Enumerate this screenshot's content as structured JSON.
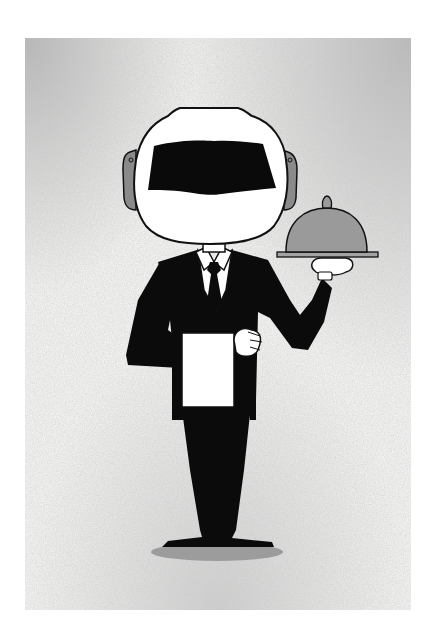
{
  "image": {
    "subject": "robot-helmeted waiter in black suit holding a silver cloche tray",
    "alt": "Illustration of a waiter with a white robot helmet and black visor, wearing a black suit and tie, a white towel over his arm, holding a domed serving cloche on a tray",
    "colors": {
      "background_page": "#ffffff",
      "grunge_panel": "#f1f1f0",
      "grunge_stain": "#bdbdbd",
      "helmet": "#ffffff",
      "visor": "#0a0a0a",
      "earpiece": "#8a8a8a",
      "suit": "#0b0b0b",
      "shirt": "#ffffff",
      "cloche": "#9a9a9a",
      "tray": "#a3a3a3",
      "shadow": "#9c9c9c",
      "outline": "#111111"
    }
  }
}
